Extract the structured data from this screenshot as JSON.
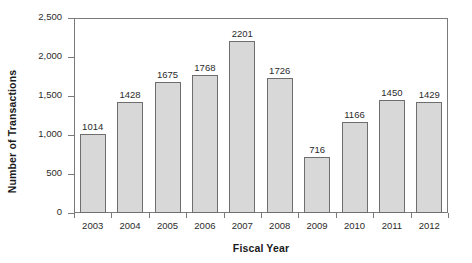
{
  "chart_data": {
    "type": "bar",
    "title": "",
    "xlabel": "Fiscal Year",
    "ylabel": "Number of Transactions",
    "categories": [
      "2003",
      "2004",
      "2005",
      "2006",
      "2007",
      "2008",
      "2009",
      "2010",
      "2011",
      "2012"
    ],
    "values": [
      1014,
      1428,
      1675,
      1768,
      2201,
      1726,
      716,
      1166,
      1450,
      1429
    ],
    "value_labels": [
      "1014",
      "1428",
      "1675",
      "1768",
      "2201",
      "1726",
      "716",
      "1166",
      "1450",
      "1429"
    ],
    "ylim": [
      0,
      2500
    ],
    "ytick_values": [
      0,
      500,
      1000,
      1500,
      2000,
      2500
    ],
    "ytick_labels": [
      "0",
      "500",
      "1,000",
      "1,500",
      "2,000",
      "2,500"
    ],
    "grid": false,
    "legend": false,
    "legend_position": "none",
    "bar_fill_color": "#d8d8d8",
    "bar_border_color": "#6e6e6e",
    "axis_color": "#7a7a7a",
    "text_color": "#2b2b2b",
    "background_color": "#ffffff"
  }
}
